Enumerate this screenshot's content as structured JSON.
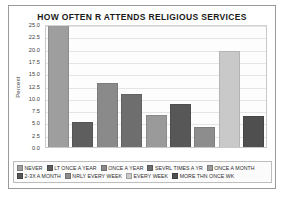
{
  "chart_data": {
    "type": "bar",
    "title": "HOW OFTEN R ATTENDS RELIGIOUS SERVICES",
    "xlabel": "",
    "ylabel": "Percent",
    "ylim": [
      0.0,
      25.0
    ],
    "ytick_labels": [
      "25.0",
      "22.5",
      "20.0",
      "17.5",
      "15.0",
      "12.5",
      "10.0",
      "7.5",
      "5.0",
      "2.5",
      "0.0"
    ],
    "ytick_values": [
      25.0,
      22.5,
      20.0,
      17.5,
      15.0,
      12.5,
      10.0,
      7.5,
      5.0,
      2.5,
      0.0
    ],
    "grid": true,
    "legend_position": "bottom",
    "categories": [
      "NEVER",
      "LT ONCE A YEAR",
      "ONCE A YEAR",
      "SEVRL TIMES A YR",
      "ONCE A MONTH",
      "2-3X A MONTH",
      "NRLY EVERY WEEK",
      "EVERY WEEK",
      "MORE THN ONCE WK"
    ],
    "values": [
      25.0,
      5.0,
      13.0,
      10.8,
      6.6,
      8.8,
      4.0,
      19.5,
      6.4
    ],
    "bar_colors": [
      "#9e9e9e",
      "#5e5e5e",
      "#8a8a8a",
      "#6e6e6e",
      "#9a9a9a",
      "#575757",
      "#8d8d8d",
      "#c9c9c9",
      "#4f4f4f"
    ],
    "legend_rows": [
      [
        {
          "label": "NEVER",
          "color": "#9e9e9e"
        },
        {
          "label": "LT ONCE A YEAR",
          "color": "#5e5e5e"
        },
        {
          "label": "ONCE A YEAR",
          "color": "#8a8a8a"
        },
        {
          "label": "SEVRL TIMES A YR",
          "color": "#6e6e6e"
        },
        {
          "label": "ONCE A MONTH",
          "color": "#9a9a9a"
        }
      ],
      [
        {
          "label": "2-3X A MONTH",
          "color": "#575757"
        },
        {
          "label": "NRLY EVERY WEEK",
          "color": "#8d8d8d"
        },
        {
          "label": "EVERY WEEK",
          "color": "#c9c9c9"
        },
        {
          "label": "MORE THN ONCE WK",
          "color": "#4f4f4f"
        }
      ]
    ]
  }
}
